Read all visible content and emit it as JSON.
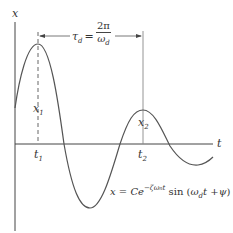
{
  "diagram": {
    "type": "damped-oscillation",
    "axes": {
      "y_label": "x",
      "x_label": "t"
    },
    "points": {
      "first_peak": {
        "value_label": "x",
        "value_sub": "1",
        "time_label": "t",
        "time_sub": "1"
      },
      "second_peak": {
        "value_label": "x",
        "value_sub": "2",
        "time_label": "t",
        "time_sub": "2"
      }
    },
    "period": {
      "symbol": "τ",
      "symbol_sub": "d",
      "equals": "=",
      "numerator": "2π",
      "denominator": "ω",
      "denominator_sub": "d"
    },
    "formula": {
      "lhs": "x",
      "equals": " = ",
      "coef": "Ce",
      "exponent": "−ζω",
      "exponent_sub": "n",
      "exponent_t": "t",
      "func": " sin (",
      "omega": "ω",
      "omega_sub": "d",
      "t": "t",
      "plus": " +",
      "psi": "ψ",
      "close": ")"
    },
    "colors": {
      "curve": "#555555",
      "axis": "#444444",
      "text": "#333333"
    }
  }
}
